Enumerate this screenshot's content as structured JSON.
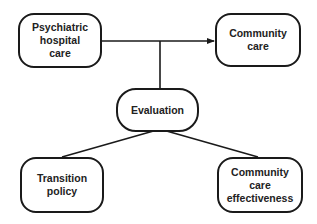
{
  "diagram": {
    "nodes": [
      {
        "id": "hospital",
        "label": "Psychiatric\nhospital\ncare"
      },
      {
        "id": "community",
        "label": "Community\ncare"
      },
      {
        "id": "evaluation",
        "label": "Evaluation"
      },
      {
        "id": "transition",
        "label": "Transition\npolicy"
      },
      {
        "id": "effectiveness",
        "label": "Community\ncare\neffectiveness"
      }
    ],
    "edges": [
      {
        "from": "hospital",
        "to": "community",
        "type": "arrow"
      },
      {
        "from": "evaluation",
        "to": "hospital-community-link",
        "type": "line"
      },
      {
        "from": "evaluation",
        "to": "transition",
        "type": "line"
      },
      {
        "from": "evaluation",
        "to": "effectiveness",
        "type": "line"
      }
    ],
    "colors": {
      "stroke": "#1a1a1a",
      "text": "#222222",
      "background": "#ffffff"
    }
  }
}
